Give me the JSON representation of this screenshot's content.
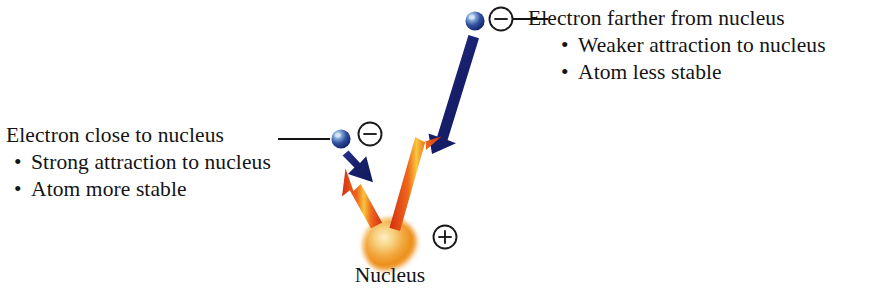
{
  "figure": {
    "type": "scientific-diagram",
    "background_color": "#ffffff"
  },
  "labels": {
    "left": {
      "title": "Electron close to nucleus",
      "bullets": [
        "Strong attraction to nucleus",
        "Atom more stable"
      ],
      "bullet_char": "•"
    },
    "right": {
      "title": "Electron farther from nucleus",
      "bullets": [
        "Weaker attraction to nucleus",
        "Atom less stable"
      ],
      "bullet_char": "•"
    }
  },
  "nucleus": {
    "caption": "Nucleus",
    "charge_symbol": "⊕",
    "charge_sign": "+",
    "color_core": "#f7d98a",
    "color_mid": "#f0a03a",
    "color_edge": "#e8891f"
  },
  "electrons": [
    {
      "id": "electron-near",
      "charge_symbol": "⊖",
      "charge_sign": "−",
      "position": "close-to-nucleus",
      "color_core": "#8fb4dd",
      "color_edge": "#12246e"
    },
    {
      "id": "electron-far",
      "charge_symbol": "⊖",
      "charge_sign": "−",
      "position": "far-from-nucleus",
      "color_core": "#8fb4dd",
      "color_edge": "#12246e"
    }
  ],
  "arrows": {
    "attraction_blue_color": "#1d2270",
    "attraction_red_color": "#e23b18",
    "attraction_red_highlight": "#f5c23a",
    "pairs": [
      {
        "name": "short-attraction-pair",
        "description": "Strong short attraction between near electron and nucleus",
        "length": "short"
      },
      {
        "name": "long-attraction-pair",
        "description": "Weak long attraction between far electron and nucleus",
        "length": "long"
      }
    ]
  },
  "leader_lines": {
    "left_label_to_electron": "solid-line",
    "right_electron_to_label": "solid-line",
    "color": "#141414"
  }
}
